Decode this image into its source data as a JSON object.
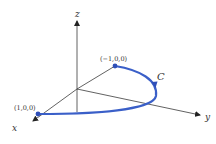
{
  "axes": {
    "x_label": "x",
    "y_label": "y",
    "z_label": "z"
  },
  "points": [
    {
      "label": "(1,0,0)",
      "color": "#2f4fb8"
    },
    {
      "label": "(−1,0,0)",
      "color": "#2f4fb8"
    }
  ],
  "curve": {
    "label": "C",
    "color": "#3a5fc8"
  }
}
